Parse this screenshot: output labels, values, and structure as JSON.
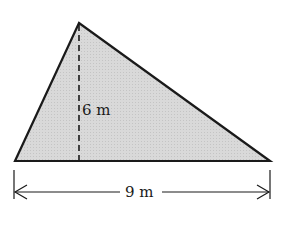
{
  "diagram": {
    "shape": "triangle",
    "fill_color": "#d6d6d6",
    "stroke_color": "#1a1a1a",
    "vertices": {
      "apex": [
        79,
        23
      ],
      "base_left": [
        15,
        161
      ],
      "base_right": [
        270,
        161
      ]
    },
    "height_label": "6 m",
    "base_label": "9 m"
  }
}
